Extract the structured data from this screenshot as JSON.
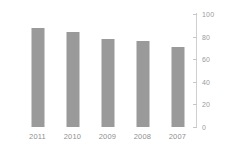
{
  "chart_data": {
    "type": "bar",
    "title": "",
    "subtitle": "",
    "xlabel": "",
    "ylabel": "",
    "categories": [
      "2011",
      "2010",
      "2009",
      "2008",
      "2007"
    ],
    "values": [
      88,
      84,
      78,
      76,
      71
    ],
    "series": [
      {
        "name": "",
        "values": [
          88,
          84,
          78,
          76,
          71
        ],
        "color": "#9a9a9a"
      }
    ],
    "ylim": [
      0,
      100
    ],
    "yticks": [
      0,
      20,
      40,
      60,
      80,
      100
    ],
    "ytick_labels": [
      "0",
      "20",
      "40",
      "60",
      "80",
      "100"
    ],
    "grid": false,
    "legend": false,
    "legend_position": "none",
    "y_axis_position": "right",
    "annotations": []
  },
  "style": {
    "bar_color": "#9a9a9a",
    "axis_color": "#d0d0d0",
    "tick_label_color": "#9b9b9b",
    "category_label_color": "#8f8f8f",
    "background": "#ffffff"
  }
}
